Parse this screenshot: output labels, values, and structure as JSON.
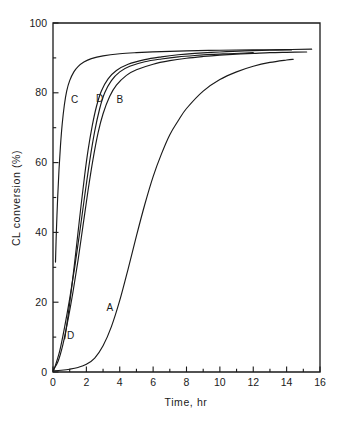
{
  "chart_data": {
    "type": "line",
    "title": "",
    "xlabel": "Time, hr",
    "ylabel": "CL conversion (%)",
    "xlim": [
      0,
      16
    ],
    "ylim": [
      0,
      100
    ],
    "xticks": [
      0,
      2,
      4,
      6,
      8,
      10,
      12,
      14,
      16
    ],
    "xtick_labels": [
      "0",
      "2",
      "4",
      "6",
      "8",
      "10",
      "12",
      "14",
      "16"
    ],
    "x_minor_ticks": [
      1,
      3,
      5,
      7,
      9,
      11,
      13,
      15
    ],
    "yticks": [
      0,
      20,
      40,
      60,
      80,
      100
    ],
    "ytick_labels": [
      "0",
      "20",
      "40",
      "60",
      "80",
      "100"
    ],
    "y_minor_ticks": [
      10,
      30,
      50,
      70,
      90
    ],
    "grid": false,
    "legend": "inline-curve-labels",
    "series": [
      {
        "name": "A",
        "label": "A",
        "label_x": 3.4,
        "label_y": 18.5,
        "points": [
          [
            0.0,
            0.3
          ],
          [
            0.5,
            0.5
          ],
          [
            1.0,
            0.8
          ],
          [
            1.5,
            1.3
          ],
          [
            2.0,
            2.2
          ],
          [
            2.5,
            4.0
          ],
          [
            3.0,
            7.5
          ],
          [
            3.5,
            13.0
          ],
          [
            4.0,
            20.5
          ],
          [
            4.5,
            29.5
          ],
          [
            5.0,
            39.0
          ],
          [
            5.5,
            48.0
          ],
          [
            6.0,
            56.0
          ],
          [
            6.5,
            62.5
          ],
          [
            7.0,
            68.0
          ],
          [
            7.5,
            72.0
          ],
          [
            8.0,
            75.5
          ],
          [
            9.0,
            80.5
          ],
          [
            10.0,
            83.8
          ],
          [
            11.0,
            86.0
          ],
          [
            12.0,
            87.6
          ],
          [
            13.0,
            88.7
          ],
          [
            14.0,
            89.4
          ],
          [
            14.4,
            89.6
          ]
        ]
      },
      {
        "name": "B",
        "label": "B",
        "label_x": 4.0,
        "label_y": 78.0,
        "points": [
          [
            0.0,
            0.5
          ],
          [
            0.3,
            3.0
          ],
          [
            0.6,
            8.0
          ],
          [
            0.9,
            15.0
          ],
          [
            1.2,
            23.0
          ],
          [
            1.5,
            32.0
          ],
          [
            1.8,
            42.0
          ],
          [
            2.1,
            52.0
          ],
          [
            2.4,
            61.0
          ],
          [
            2.7,
            68.5
          ],
          [
            3.0,
            74.0
          ],
          [
            3.4,
            79.0
          ],
          [
            3.8,
            82.2
          ],
          [
            4.4,
            85.0
          ],
          [
            5.0,
            86.6
          ],
          [
            6.0,
            88.2
          ],
          [
            7.0,
            89.2
          ],
          [
            8.0,
            89.9
          ],
          [
            9.0,
            90.4
          ],
          [
            10.0,
            90.8
          ],
          [
            11.0,
            91.1
          ],
          [
            12.0,
            91.3
          ],
          [
            13.0,
            91.5
          ],
          [
            14.0,
            91.6
          ],
          [
            15.2,
            91.7
          ]
        ]
      },
      {
        "name": "C",
        "label": "C",
        "label_x": 1.3,
        "label_y": 78.0,
        "points": [
          [
            0.15,
            31.5
          ],
          [
            0.2,
            40.0
          ],
          [
            0.28,
            50.0
          ],
          [
            0.36,
            58.0
          ],
          [
            0.45,
            65.0
          ],
          [
            0.55,
            71.0
          ],
          [
            0.68,
            76.5
          ],
          [
            0.82,
            80.5
          ],
          [
            1.0,
            83.5
          ],
          [
            1.25,
            86.0
          ],
          [
            1.5,
            87.5
          ],
          [
            1.85,
            88.8
          ],
          [
            2.3,
            89.8
          ],
          [
            3.0,
            90.6
          ],
          [
            4.0,
            91.2
          ],
          [
            5.0,
            91.5
          ],
          [
            6.5,
            91.8
          ],
          [
            8.0,
            92.0
          ],
          [
            10.0,
            92.2
          ],
          [
            12.0,
            92.3
          ],
          [
            14.0,
            92.4
          ],
          [
            15.5,
            92.5
          ]
        ]
      },
      {
        "name": "D-upper",
        "label": "D",
        "label_x": 2.8,
        "label_y": 78.5,
        "points": [
          [
            0.05,
            0.5
          ],
          [
            0.4,
            6.0
          ],
          [
            0.7,
            13.0
          ],
          [
            1.0,
            21.0
          ],
          [
            1.3,
            30.0
          ],
          [
            1.6,
            40.0
          ],
          [
            1.9,
            50.5
          ],
          [
            2.2,
            60.5
          ],
          [
            2.5,
            69.0
          ],
          [
            2.8,
            75.5
          ],
          [
            3.1,
            80.0
          ],
          [
            3.5,
            83.5
          ],
          [
            4.0,
            86.0
          ],
          [
            4.6,
            87.6
          ],
          [
            5.5,
            88.9
          ],
          [
            6.5,
            89.7
          ],
          [
            7.5,
            90.3
          ],
          [
            8.5,
            90.7
          ],
          [
            9.5,
            91.0
          ],
          [
            10.5,
            91.2
          ],
          [
            11.5,
            91.4
          ],
          [
            12.0,
            91.5
          ]
        ]
      },
      {
        "name": "D-lower",
        "label": "D",
        "label_x": 1.05,
        "label_y": 10.5,
        "points": [
          [
            0.7,
            9.5
          ],
          [
            0.9,
            16.0
          ],
          [
            1.1,
            23.5
          ],
          [
            1.3,
            31.5
          ],
          [
            1.5,
            40.0
          ],
          [
            1.7,
            48.5
          ],
          [
            1.9,
            56.5
          ],
          [
            2.1,
            63.5
          ],
          [
            2.35,
            70.5
          ],
          [
            2.6,
            76.0
          ],
          [
            2.9,
            80.5
          ],
          [
            3.3,
            84.0
          ],
          [
            3.8,
            86.4
          ],
          [
            4.5,
            88.2
          ],
          [
            5.5,
            89.5
          ],
          [
            6.5,
            90.3
          ],
          [
            7.5,
            90.9
          ],
          [
            8.5,
            91.3
          ],
          [
            10.0,
            91.7
          ],
          [
            11.5,
            92.0
          ],
          [
            13.0,
            92.2
          ],
          [
            14.3,
            92.3
          ]
        ]
      }
    ]
  }
}
